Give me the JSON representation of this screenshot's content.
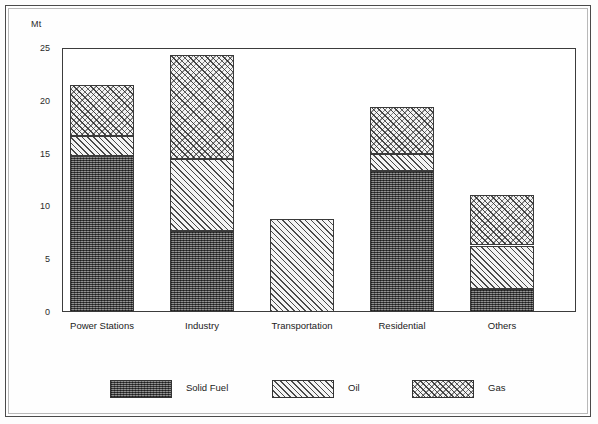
{
  "chart": {
    "type": "bar",
    "unit_label": "Mt",
    "title": "",
    "xlabel": "",
    "ylabel": "Mt"
  },
  "axis": {
    "y_ticks": [
      "0",
      "5",
      "10",
      "15",
      "20",
      "25"
    ],
    "y_min": 0,
    "y_max": 25
  },
  "legend": {
    "items": [
      {
        "label": "Solid Fuel",
        "texture": "dark-stipple",
        "color": "#6a6a6a"
      },
      {
        "label": "Oil",
        "texture": "diagonal-hatch",
        "color": "#f2f2f2"
      },
      {
        "label": "Gas",
        "texture": "fine-dots",
        "color": "#f3f3f3"
      }
    ]
  },
  "chart_data": {
    "type": "bar",
    "subtype": "stacked",
    "title": "",
    "xlabel": "",
    "ylabel": "Mt",
    "ylim": [
      0,
      25
    ],
    "yticks": [
      0,
      5,
      10,
      15,
      20,
      25
    ],
    "grid": false,
    "legend_position": "bottom",
    "categories": [
      "Power Stations",
      "Industry",
      "Transportation",
      "Residential",
      "Others"
    ],
    "series": [
      {
        "name": "Solid Fuel",
        "values": [
          14.8,
          7.7,
          0.0,
          13.4,
          2.2
        ]
      },
      {
        "name": "Oil",
        "values": [
          1.9,
          6.8,
          8.8,
          1.6,
          4.1
        ]
      },
      {
        "name": "Gas",
        "values": [
          4.8,
          9.8,
          0.0,
          4.4,
          4.8
        ]
      }
    ],
    "totals": [
      21.5,
      24.3,
      8.8,
      19.4,
      11.1
    ]
  },
  "categories_labels": {
    "c0": "Power Stations",
    "c1": "Industry",
    "c2": "Transportation",
    "c3": "Residential",
    "c4": "Others"
  }
}
